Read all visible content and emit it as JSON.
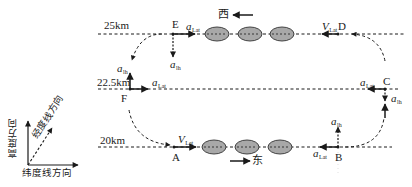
{
  "altitudes": {
    "top": "25km",
    "middle": "22.5km",
    "bottom": "20km"
  },
  "points": {
    "A": "A",
    "B": "B",
    "C": "C",
    "D": "D",
    "E": "E",
    "F": "F"
  },
  "vectors": {
    "a_symbol": "a",
    "v_symbol": "V",
    "lat_sub": "Lat",
    "lh_sub": "lh"
  },
  "directions": {
    "west": "西",
    "east": "东"
  },
  "axes_legend": {
    "altitude": "高度方向",
    "longitude": "经度线方向",
    "latitude": "纬度线方向"
  },
  "colors": {
    "line": "#1a1a1a",
    "ellipse_fill": "#a8a8a8",
    "ellipse_stroke": "#333333"
  }
}
